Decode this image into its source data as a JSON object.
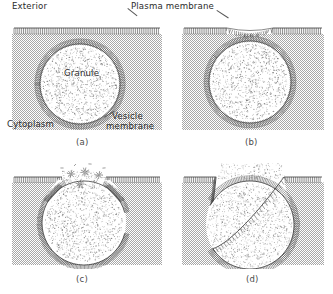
{
  "figure": {
    "width": 333,
    "height": 294,
    "background_color": "#ffffff"
  },
  "colors": {
    "ink": "#2b2b2b",
    "panel_label": "#4a4a4a",
    "cytoplasm_fill": "#cfcfcf",
    "membrane_line": "#3a3a3a",
    "stipple": "#6e6e6e",
    "leader": "#555555"
  },
  "annotations": {
    "exterior": {
      "text": "Exterior",
      "panel": "a"
    },
    "plasma_membrane": {
      "text": "Plasma membrane",
      "panel": "a-b"
    },
    "granule": {
      "text": "Granule",
      "panel": "a"
    },
    "cytoplasm": {
      "text": "Cytoplasm",
      "panel": "a"
    },
    "vesicle_membrane_line1": {
      "text": "Vesicle",
      "panel": "a"
    },
    "vesicle_membrane_line2": {
      "text": "membrane",
      "panel": "a"
    }
  },
  "panels": [
    {
      "id": "a",
      "label": "(a)",
      "stage": "Secretory granule approaches the plasma membrane",
      "granule_state": "intact, separated from plasma membrane",
      "pore_open": false,
      "release": false
    },
    {
      "id": "b",
      "label": "(b)",
      "stage": "Vesicle membrane contacts the plasma membrane",
      "granule_state": "intact, apposed to plasma membrane",
      "pore_open": false,
      "release": false
    },
    {
      "id": "c",
      "label": "(c)",
      "stage": "Membranes fuse and a pore forms; micelles released",
      "granule_state": "fusing, pore opening",
      "pore_open": true,
      "release": true
    },
    {
      "id": "d",
      "label": "(d)",
      "stage": "Membranes are continuous; granule contents discharged to exterior",
      "granule_state": "open pit, contents dispersing",
      "pore_open": true,
      "release": true
    }
  ]
}
